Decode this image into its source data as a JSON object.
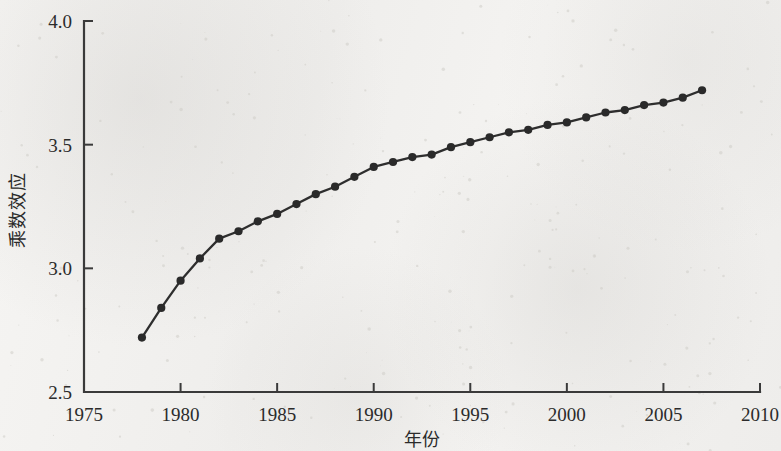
{
  "chart_data": {
    "type": "line",
    "title": "",
    "subtitle": "",
    "xlabel": "年份",
    "ylabel": "乘数效应",
    "xlim": [
      1975,
      2010
    ],
    "ylim": [
      2.5,
      4.0
    ],
    "xticks": [
      1975,
      1980,
      1985,
      1990,
      1995,
      2000,
      2005,
      2010
    ],
    "xtick_labels": [
      "1975",
      "1980",
      "1985",
      "1990",
      "1995",
      "2000",
      "2005",
      "2010"
    ],
    "yticks": [
      2.5,
      3.0,
      3.5,
      4.0
    ],
    "ytick_labels": [
      "2.5",
      "3.0",
      "3.5",
      "4.0"
    ],
    "grid": false,
    "legend": null,
    "legend_position": "none",
    "marker": "circle",
    "line_color": "#2e2e2e",
    "marker_color": "#2a2a2a",
    "background_color": "#f3f2f0",
    "axis_color": "#3a3a3a",
    "x": [
      1978,
      1979,
      1980,
      1981,
      1982,
      1983,
      1984,
      1985,
      1986,
      1987,
      1988,
      1989,
      1990,
      1991,
      1992,
      1993,
      1994,
      1995,
      1996,
      1997,
      1998,
      1999,
      2000,
      2001,
      2002,
      2003,
      2004,
      2005,
      2006,
      2007
    ],
    "values": [
      2.72,
      2.84,
      2.95,
      3.04,
      3.12,
      3.15,
      3.19,
      3.22,
      3.26,
      3.3,
      3.33,
      3.37,
      3.41,
      3.43,
      3.45,
      3.46,
      3.49,
      3.51,
      3.53,
      3.55,
      3.56,
      3.58,
      3.59,
      3.61,
      3.63,
      3.64,
      3.66,
      3.67,
      3.69,
      3.72
    ],
    "series": [
      {
        "name": "乘数效应",
        "x": [
          1978,
          1979,
          1980,
          1981,
          1982,
          1983,
          1984,
          1985,
          1986,
          1987,
          1988,
          1989,
          1990,
          1991,
          1992,
          1993,
          1994,
          1995,
          1996,
          1997,
          1998,
          1999,
          2000,
          2001,
          2002,
          2003,
          2004,
          2005,
          2006,
          2007
        ],
        "values": [
          2.72,
          2.84,
          2.95,
          3.04,
          3.12,
          3.15,
          3.19,
          3.22,
          3.26,
          3.3,
          3.33,
          3.37,
          3.41,
          3.43,
          3.45,
          3.46,
          3.49,
          3.51,
          3.53,
          3.55,
          3.56,
          3.58,
          3.59,
          3.61,
          3.63,
          3.64,
          3.66,
          3.67,
          3.69,
          3.72
        ]
      }
    ]
  }
}
